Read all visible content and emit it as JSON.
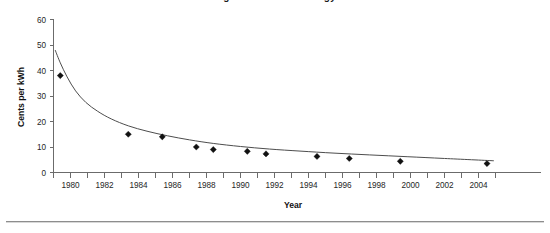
{
  "figure": {
    "title_partial": "Figure — Cost of Energy",
    "background_color": "#ffffff",
    "rule_color": "#8d8d8d"
  },
  "chart_data": {
    "type": "scatter",
    "title": "",
    "xlabel": "Year",
    "ylabel": "Cents per kWh",
    "xlim": [
      1979,
      2005
    ],
    "ylim": [
      0,
      60
    ],
    "grid": false,
    "legend": null,
    "x_ticks_major": [
      1980,
      1982,
      1984,
      1986,
      1988,
      1990,
      1992,
      1994,
      1996,
      1998,
      2000,
      2002,
      2004
    ],
    "x_tick_labels": [
      "1980",
      "1982",
      "1984",
      "1986",
      "1988",
      "1990",
      "1992",
      "1994",
      "1996",
      "1998",
      "2000",
      "2002",
      "2004"
    ],
    "x_minor_tick_step": 1,
    "y_ticks": [
      0,
      10,
      20,
      30,
      40,
      50,
      60
    ],
    "y_tick_labels": [
      "0",
      "10",
      "20",
      "30",
      "40",
      "50",
      "60"
    ],
    "marker_style": "filled-diamond",
    "marker_color": "#111111",
    "curve_color": "#4d4d4d",
    "points": [
      {
        "x": 1979.4,
        "y": 38.0
      },
      {
        "x": 1983.4,
        "y": 15.0
      },
      {
        "x": 1985.4,
        "y": 14.0
      },
      {
        "x": 1987.4,
        "y": 10.0
      },
      {
        "x": 1988.4,
        "y": 9.0
      },
      {
        "x": 1990.4,
        "y": 8.3
      },
      {
        "x": 1991.5,
        "y": 7.3
      },
      {
        "x": 1994.5,
        "y": 6.3
      },
      {
        "x": 1996.4,
        "y": 5.5
      },
      {
        "x": 1999.4,
        "y": 4.4
      },
      {
        "x": 2004.5,
        "y": 3.5
      }
    ],
    "trend_curve": [
      {
        "x": 1979.1,
        "y": 48.0
      },
      {
        "x": 1979.4,
        "y": 43.0
      },
      {
        "x": 1979.8,
        "y": 37.5
      },
      {
        "x": 1980.3,
        "y": 32.0
      },
      {
        "x": 1980.9,
        "y": 27.5
      },
      {
        "x": 1981.6,
        "y": 24.0
      },
      {
        "x": 1982.4,
        "y": 21.0
      },
      {
        "x": 1983.4,
        "y": 18.3
      },
      {
        "x": 1984.5,
        "y": 16.2
      },
      {
        "x": 1985.7,
        "y": 14.4
      },
      {
        "x": 1987.0,
        "y": 12.8
      },
      {
        "x": 1988.4,
        "y": 11.4
      },
      {
        "x": 1990.0,
        "y": 10.2
      },
      {
        "x": 1991.7,
        "y": 9.2
      },
      {
        "x": 1993.5,
        "y": 8.4
      },
      {
        "x": 1995.5,
        "y": 7.6
      },
      {
        "x": 1997.6,
        "y": 6.9
      },
      {
        "x": 1999.8,
        "y": 6.2
      },
      {
        "x": 2002.0,
        "y": 5.5
      },
      {
        "x": 2004.9,
        "y": 4.6
      }
    ]
  }
}
